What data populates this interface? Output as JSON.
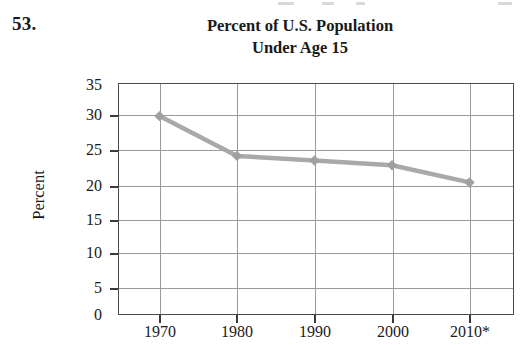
{
  "problem": {
    "number": "53."
  },
  "chart_data": {
    "type": "line",
    "title": "Percent of U.S. Population Under Age 15",
    "title_lines": [
      "Percent of U.S. Population",
      "Under Age 15"
    ],
    "xlabel": "",
    "ylabel": "Percent",
    "categories": [
      "1970",
      "1980",
      "1990",
      "2000",
      "2010*"
    ],
    "x": [
      1970,
      1980,
      1990,
      2000,
      2010
    ],
    "values": [
      30,
      24,
      23.3,
      22.6,
      20
    ],
    "series": [
      {
        "name": "Percent of U.S. population under age 15",
        "values": [
          30,
          24,
          23.3,
          22.6,
          20
        ]
      }
    ],
    "ylim": [
      0,
      35
    ],
    "yticks": [
      0,
      5,
      10,
      15,
      20,
      25,
      30,
      35
    ],
    "ytick_labels": [
      "0",
      "5",
      "10",
      "15",
      "20",
      "25",
      "30",
      "35"
    ],
    "xtick_labels": [
      "1970",
      "1980",
      "1990",
      "2000",
      "2010*"
    ],
    "grid": "both",
    "legend": "none",
    "line_color": "#a9a9a9",
    "marker": "diamond",
    "marker_color": "#a0a0a0",
    "axis_color": "#4a4a4a",
    "grid_color": "#9a9a9a",
    "note": "2010* denotes projected value"
  }
}
